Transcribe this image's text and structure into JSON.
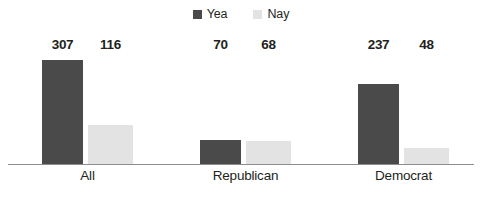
{
  "chart_data": {
    "type": "bar",
    "title": "",
    "xlabel": "",
    "ylabel": "",
    "categories": [
      "All",
      "Republican",
      "Democrat"
    ],
    "series": [
      {
        "name": "Yea",
        "color": "#4a4a4a",
        "values": [
          307,
          70,
          237
        ]
      },
      {
        "name": "Nay",
        "color": "#e3e3e3",
        "values": [
          116,
          68,
          48
        ]
      }
    ],
    "ylim": [
      0,
      307
    ],
    "grid": false,
    "legend_position": "top-center",
    "value_labels": true
  },
  "legend": {
    "items": [
      {
        "label": "Yea",
        "swatch": "legend-swatch-yea"
      },
      {
        "label": "Nay",
        "swatch": "legend-swatch-nay"
      }
    ]
  },
  "groups": [
    {
      "category": "All",
      "yea_value": "307",
      "nay_value": "116"
    },
    {
      "category": "Republican",
      "yea_value": "70",
      "nay_value": "68"
    },
    {
      "category": "Democrat",
      "yea_value": "237",
      "nay_value": "48"
    }
  ]
}
